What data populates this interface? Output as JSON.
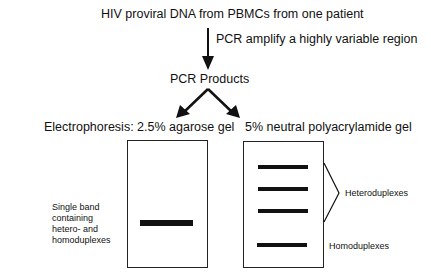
{
  "diagram": {
    "source": "HIV proviral DNA from PBMCs from one patient",
    "step_label": "PCR amplify a highly variable region",
    "products": "PCR Products",
    "left_gel": {
      "title": "Electrophoresis:  2.5% agarose gel",
      "band_label_lines": [
        "Single band",
        "containing",
        "hetero-  and",
        "homoduplexes"
      ]
    },
    "right_gel": {
      "title": "5% neutral polyacrylamide gel",
      "heteroduplex_label": "Heteroduplexes",
      "homoduplex_label": "Homoduplexes"
    }
  }
}
